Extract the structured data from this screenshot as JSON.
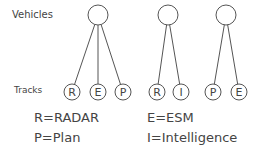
{
  "labels": {
    "vehicles": "Vehicles",
    "tracks": "Tracks"
  },
  "vehicles": [
    {
      "cx": 98,
      "cy": 15
    },
    {
      "cx": 168,
      "cy": 15
    },
    {
      "cx": 226,
      "cy": 15
    }
  ],
  "tracks": [
    {
      "letter": "R",
      "cx": 72,
      "vehicle": 0
    },
    {
      "letter": "E",
      "cx": 98,
      "vehicle": 0
    },
    {
      "letter": "P",
      "cx": 123,
      "vehicle": 0
    },
    {
      "letter": "R",
      "cx": 157,
      "vehicle": 1
    },
    {
      "letter": "I",
      "cx": 181,
      "vehicle": 1
    },
    {
      "letter": "P",
      "cx": 213,
      "vehicle": 2
    },
    {
      "letter": "E",
      "cx": 239,
      "vehicle": 2
    }
  ],
  "legend": {
    "radar": "R=RADAR",
    "esm": "E=ESM",
    "plan": "P=Plan",
    "intel": "I=Intelligence"
  },
  "colors": {
    "stroke": "#555555",
    "text": "#444444"
  }
}
